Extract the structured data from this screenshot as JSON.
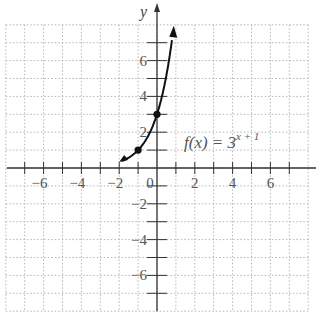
{
  "chart_data": {
    "type": "line",
    "title": "",
    "function_label": {
      "prefix": "f(x) = 3",
      "exponent": "x + 1"
    },
    "xlabel": "",
    "ylabel": "y",
    "xlim": [
      -8,
      8
    ],
    "ylim": [
      -8,
      8
    ],
    "grid": true,
    "x_tick_labels": [
      "-6",
      "-4",
      "-2",
      "0",
      "2",
      "4",
      "6"
    ],
    "x_tick_values": [
      -6,
      -4,
      -2,
      0,
      2,
      4,
      6
    ],
    "y_tick_labels": [
      "6",
      "4",
      "2",
      "-2",
      "-4",
      "-6"
    ],
    "y_tick_values": [
      6,
      4,
      2,
      -2,
      -4,
      -6
    ],
    "series": [
      {
        "name": "f(x) = 3^(x+1)",
        "x": [
          -2,
          -1.5,
          -1,
          -0.5,
          0,
          0.25,
          0.5,
          0.85
        ],
        "y": [
          0.333,
          0.577,
          1,
          1.732,
          3,
          3.948,
          5.196,
          7.7
        ]
      }
    ],
    "marked_points": [
      {
        "x": -1,
        "y": 1
      },
      {
        "x": 0,
        "y": 3
      }
    ],
    "colors": {
      "curve": "#111111",
      "axes": "#333333",
      "grid": "#b5b5b5",
      "text": "#555555"
    }
  }
}
